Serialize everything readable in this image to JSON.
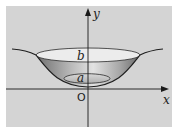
{
  "figure": {
    "background": "#d4d4d4",
    "axes": {
      "x_label": "x",
      "y_label": "y",
      "origin_label": "O"
    },
    "levels": {
      "upper_label": "b",
      "lower_label": "a"
    },
    "colors": {
      "axis": "#1a1a1a",
      "curve": "#2a2a2a",
      "rim_fill": "#ececec",
      "bowl_shade_light": "#bdbdbd",
      "bowl_shade_dark": "#7a7a7a",
      "inner_ellipse_fill": "#c9c9c9"
    }
  }
}
